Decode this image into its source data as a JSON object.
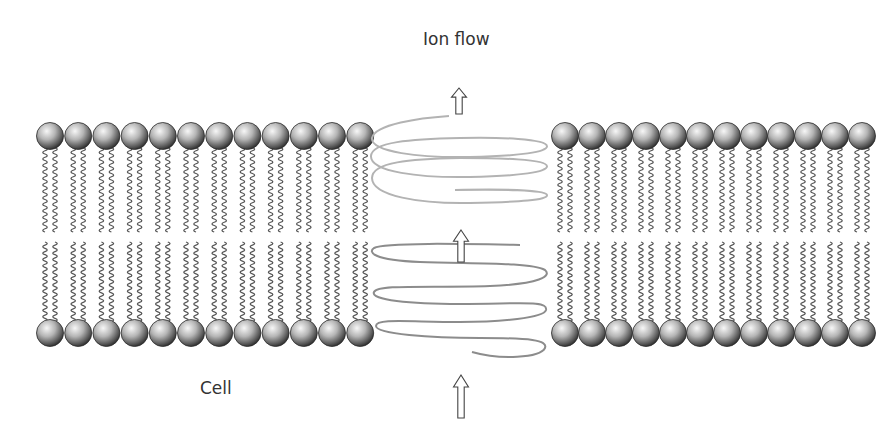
{
  "labels": {
    "ion_flow": "Ion flow",
    "cell": "Cell"
  },
  "diagram": {
    "type": "membrane-ion-channel",
    "membrane_left": {
      "heads_per_row": 12,
      "x_start": 50,
      "spacing": 28.2,
      "tails_per_head": 2
    },
    "membrane_right": {
      "heads_per_row": 12,
      "x_start": 565,
      "spacing": 27.0,
      "tails_per_head": 2
    },
    "top_row_y": 136,
    "bottom_row_y": 333,
    "head_radius": 13.5,
    "channel": {
      "shape": "helix",
      "x_left": 370,
      "x_right": 548,
      "upper_turns": 3,
      "lower_turns": 3
    },
    "arrows": [
      {
        "name": "top-arrow",
        "direction": "up",
        "x": 459,
        "y_top": 88,
        "y_bottom": 114
      },
      {
        "name": "middle-arrow",
        "direction": "up",
        "x": 461,
        "y_top": 230,
        "y_bottom": 262
      },
      {
        "name": "bottom-arrow",
        "direction": "up",
        "x": 461,
        "y_top": 375,
        "y_bottom": 418
      }
    ]
  },
  "colors": {
    "text": "#333333",
    "head_light": "#f2f2f2",
    "head_mid": "#9a9a9a",
    "head_dark": "#2e2e2e",
    "tail": "#555555",
    "helix_upper": "#b3b3b3",
    "helix_lower": "#8c8c8c",
    "arrow_stroke": "#444444"
  }
}
